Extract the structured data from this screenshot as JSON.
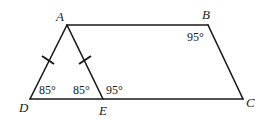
{
  "figure": {
    "type": "geometry-diagram",
    "shape": "quadrilateral ABCD with segment AE",
    "vertices": [
      {
        "name": "A",
        "label": "A",
        "x": 67,
        "y": 25
      },
      {
        "name": "B",
        "label": "B",
        "x": 208,
        "y": 25
      },
      {
        "name": "C",
        "label": "C",
        "x": 243,
        "y": 99
      },
      {
        "name": "D",
        "label": "D",
        "x": 30,
        "y": 99
      },
      {
        "name": "E",
        "label": "E",
        "x": 103,
        "y": 99
      }
    ],
    "segments": [
      "AB",
      "BC",
      "DC",
      "AD",
      "AE"
    ],
    "congruence_marks": [
      "AD",
      "AE"
    ],
    "angles": [
      {
        "at": "D",
        "label": "85°"
      },
      {
        "at": "E (AED)",
        "label": "85°"
      },
      {
        "at": "E (AEC)",
        "label": "95°"
      },
      {
        "at": "B",
        "label": "95°"
      }
    ],
    "stroke_color": "#1a1a1a",
    "background": "#ffffff"
  }
}
